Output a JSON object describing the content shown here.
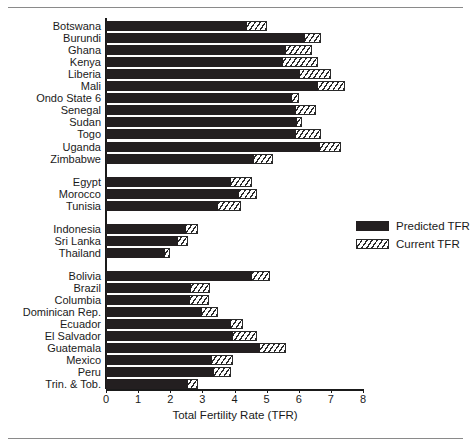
{
  "figure": {
    "clipped_header_text": "",
    "legend": {
      "position": "right-middle",
      "entries": [
        {
          "label": "Predicted TFR",
          "style": "solid-black",
          "color": "#231f20"
        },
        {
          "label": "Current TFR",
          "style": "hatched",
          "color": "#2a2a2a"
        }
      ]
    }
  },
  "chart_data": {
    "type": "bar",
    "orientation": "horizontal",
    "title": "",
    "xlabel": "Total Fertility Rate (TFR)",
    "ylabel": "",
    "xlim": [
      0,
      8
    ],
    "xticks": [
      0,
      1,
      2,
      3,
      4,
      5,
      6,
      7,
      8
    ],
    "xticklabels": [
      "0",
      "1",
      "2",
      "3",
      "4",
      "5",
      "6",
      "7",
      "8"
    ],
    "grid": false,
    "legend_position": "right",
    "series": [
      {
        "name": "Predicted TFR",
        "style": "solid-black"
      },
      {
        "name": "Current TFR",
        "style": "hatched"
      }
    ],
    "groups": [
      {
        "name": "Sub-Saharan Africa",
        "rows": [
          {
            "category": "Botswana",
            "predicted": 4.4,
            "current": 5.0
          },
          {
            "category": "Burundi",
            "predicted": 6.2,
            "current": 6.7
          },
          {
            "category": "Ghana",
            "predicted": 5.6,
            "current": 6.4
          },
          {
            "category": "Kenya",
            "predicted": 5.5,
            "current": 6.6
          },
          {
            "category": "Liberia",
            "predicted": 6.05,
            "current": 7.0
          },
          {
            "category": "Mali",
            "predicted": 6.6,
            "current": 7.45
          },
          {
            "category": "Ondo State 6",
            "predicted": 5.8,
            "current": 6.0
          },
          {
            "category": "Senegal",
            "predicted": 5.9,
            "current": 6.55
          },
          {
            "category": "Sudan",
            "predicted": 5.95,
            "current": 6.1
          },
          {
            "category": "Togo",
            "predicted": 5.9,
            "current": 6.7
          },
          {
            "category": "Uganda",
            "predicted": 6.65,
            "current": 7.3
          },
          {
            "category": "Zimbabwe",
            "predicted": 4.6,
            "current": 5.2
          }
        ]
      },
      {
        "name": "North Africa",
        "rows": [
          {
            "category": "Egypt",
            "predicted": 3.9,
            "current": 4.55
          },
          {
            "category": "Morocco",
            "predicted": 4.15,
            "current": 4.7
          },
          {
            "category": "Tunisia",
            "predicted": 3.5,
            "current": 4.2
          }
        ]
      },
      {
        "name": "Asia",
        "rows": [
          {
            "category": "Indonesia",
            "predicted": 2.5,
            "current": 2.85
          },
          {
            "category": "Sri Lanka",
            "predicted": 2.25,
            "current": 2.55
          },
          {
            "category": "Thailand",
            "predicted": 1.85,
            "current": 2.0
          }
        ]
      },
      {
        "name": "Latin America",
        "rows": [
          {
            "category": "Bolivia",
            "predicted": 4.55,
            "current": 5.1
          },
          {
            "category": "Brazil",
            "predicted": 2.65,
            "current": 3.25
          },
          {
            "category": "Columbia",
            "predicted": 2.6,
            "current": 3.2
          },
          {
            "category": "Dominican Rep.",
            "predicted": 3.0,
            "current": 3.5
          },
          {
            "category": "Ecuador",
            "predicted": 3.9,
            "current": 4.25
          },
          {
            "category": "El Salvador",
            "predicted": 3.95,
            "current": 4.7
          },
          {
            "category": "Guatemala",
            "predicted": 4.8,
            "current": 5.6
          },
          {
            "category": "Mexico",
            "predicted": 3.3,
            "current": 3.95
          },
          {
            "category": "Peru",
            "predicted": 3.35,
            "current": 3.9
          },
          {
            "category": "Trin. & Tob.",
            "predicted": 2.55,
            "current": 2.85
          }
        ]
      }
    ]
  }
}
